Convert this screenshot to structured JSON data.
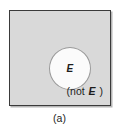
{
  "figure": {
    "caption": "(a)",
    "universe": {
      "name": "sample-space-rectangle",
      "fill_color": "#d9d9d9",
      "border_color": "#3a3a3a"
    },
    "event": {
      "label": "E",
      "fill_color": "#fbfbfb",
      "border_color": "#9a9a9a"
    },
    "complement": {
      "prefix": "(not ",
      "symbol": "E",
      "suffix": " )",
      "full_text": "(not E )"
    }
  }
}
